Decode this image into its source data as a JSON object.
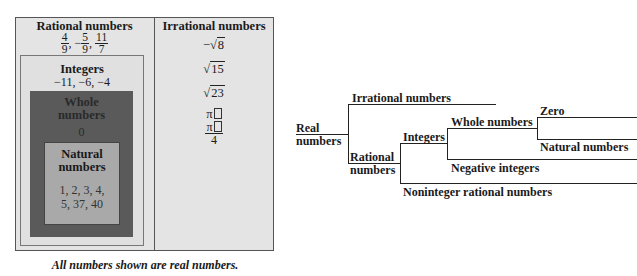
{
  "venn": {
    "rational": {
      "title": "Rational numbers",
      "fractions": [
        {
          "sign": "",
          "num": "4",
          "den": "9"
        },
        {
          "sign": "−",
          "num": "5",
          "den": "9"
        },
        {
          "sign": "",
          "num": "11",
          "den": "7"
        }
      ],
      "separator": ","
    },
    "integers": {
      "title": "Integers",
      "values": "−11, −6, −4"
    },
    "whole": {
      "title_line1": "Whole",
      "title_line2": "numbers",
      "values": "0"
    },
    "natural": {
      "title_line1": "Natural",
      "title_line2": "numbers",
      "values_line1": "1, 2, 3, 4,",
      "values_line2": "5, 37, 40"
    },
    "irrational": {
      "title": "Irrational numbers",
      "items": [
        {
          "prefix": "−",
          "radical": "8"
        },
        {
          "prefix": "",
          "radical": "15"
        },
        {
          "prefix": "",
          "radical": "23"
        }
      ],
      "pi": "π",
      "pi_frac": {
        "num": "π",
        "den": "4"
      },
      "sqrt_symbol": "√"
    },
    "caption": "All numbers shown are real numbers."
  },
  "tree": {
    "root_line1": "Real",
    "root_line2": "numbers",
    "irrational": "Irrational numbers",
    "rational_line1": "Rational",
    "rational_line2": "numbers",
    "integers": "Integers",
    "whole": "Whole numbers",
    "zero": "Zero",
    "natural": "Natural numbers",
    "negative": "Negative integers",
    "noninteger": "Noninteger rational numbers"
  }
}
